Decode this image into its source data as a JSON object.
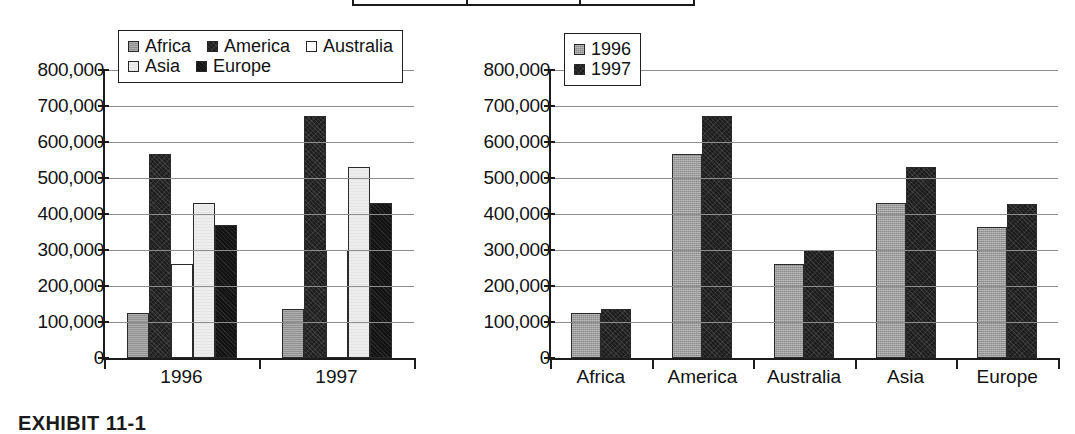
{
  "page": {
    "background": "#ffffff",
    "caption_fragment": "EXHIBIT 11-1"
  },
  "top_table_fragment": {
    "name": "partial-table-bottom-edge",
    "columns": 3
  },
  "axis": {
    "ticks": [
      "800,000",
      "700,000",
      "600,000",
      "500,000",
      "400,000",
      "300,000",
      "200,000",
      "100,000",
      "0"
    ],
    "tick_values": [
      800000,
      700000,
      600000,
      500000,
      400000,
      300000,
      200000,
      100000,
      0
    ],
    "min": 0,
    "max": 800000,
    "step": 100000
  },
  "colors": {
    "africa": "#9b9b9b",
    "america": "#1f1f1f",
    "australia": "#ffffff",
    "asia": "#ededed",
    "europe": "#131313",
    "year_1996": "#9d9d9d",
    "year_1997": "#1d1d1d",
    "gridline": "#8d8d8d",
    "axis": "#1c1c1c"
  },
  "chart_left": {
    "name": "grouped-by-year-chart",
    "legend": {
      "rows": [
        [
          {
            "label": "Africa",
            "fill": "fill-africa",
            "swatch_name": "legend-swatch-africa"
          },
          {
            "label": "America",
            "fill": "fill-america",
            "swatch_name": "legend-swatch-america"
          },
          {
            "label": "Australia",
            "fill": "fill-australia",
            "swatch_name": "legend-swatch-australia"
          }
        ],
        [
          {
            "label": "Asia",
            "fill": "fill-asia",
            "swatch_name": "legend-swatch-asia"
          },
          {
            "label": "Europe",
            "fill": "fill-europe",
            "swatch_name": "legend-swatch-europe"
          }
        ]
      ]
    }
  },
  "chart_right": {
    "name": "grouped-by-region-chart",
    "legend": {
      "rows": [
        [
          {
            "label": "1996",
            "fill": "fill-1996",
            "swatch_name": "legend-swatch-1996"
          }
        ],
        [
          {
            "label": "1997",
            "fill": "fill-1997",
            "swatch_name": "legend-swatch-1997"
          }
        ]
      ]
    }
  },
  "chart_data": [
    {
      "id": "left",
      "type": "bar",
      "title": "",
      "xlabel": "",
      "ylabel": "",
      "ylim": [
        0,
        800000
      ],
      "ytick_step": 100000,
      "grid": true,
      "legend_position": "top-center-inside",
      "grouping": "by-year",
      "categories": [
        "1996",
        "1997"
      ],
      "series": [
        {
          "name": "Africa",
          "fill": "fill-africa",
          "values": [
            125000,
            135000
          ]
        },
        {
          "name": "America",
          "fill": "fill-america",
          "values": [
            568000,
            673000
          ]
        },
        {
          "name": "Australia",
          "fill": "fill-australia",
          "values": [
            260000,
            300000
          ]
        },
        {
          "name": "Asia",
          "fill": "fill-asia",
          "values": [
            430000,
            530000
          ]
        },
        {
          "name": "Europe",
          "fill": "fill-europe",
          "values": [
            370000,
            430000
          ]
        }
      ]
    },
    {
      "id": "right",
      "type": "bar",
      "title": "",
      "xlabel": "",
      "ylabel": "",
      "ylim": [
        0,
        800000
      ],
      "ytick_step": 100000,
      "grid": true,
      "legend_position": "top-left-inside",
      "grouping": "by-region",
      "categories": [
        "Africa",
        "America",
        "Australia",
        "Asia",
        "Europe"
      ],
      "series": [
        {
          "name": "1996",
          "fill": "fill-1996",
          "values": [
            125000,
            568000,
            260000,
            430000,
            365000
          ]
        },
        {
          "name": "1997",
          "fill": "fill-1997",
          "values": [
            135000,
            673000,
            300000,
            530000,
            428000
          ]
        }
      ]
    }
  ]
}
